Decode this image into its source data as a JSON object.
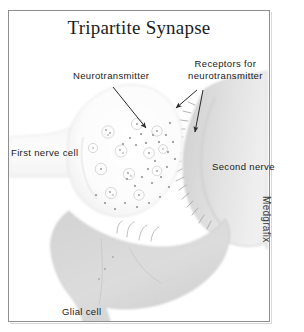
{
  "figure": {
    "title": "Tripartite Synapse",
    "credit": "Medgrafix",
    "frame_color": "#8e8e8e",
    "background_color": "#ffffff"
  },
  "labels": {
    "neurotransmitter": "Neurotransmitter",
    "receptors_line1": "Receptors for",
    "receptors_line2": "neurotransmitter",
    "first_nerve_cell": "First nerve cell",
    "second_nerve": "Second nerve",
    "glial_cell": "Glial cell"
  },
  "diagram": {
    "type": "anatomical-illustration",
    "subject": "tripartite synapse",
    "structures": [
      {
        "name": "presynaptic-terminal",
        "label": "First nerve cell",
        "fill": "#fbfbfb",
        "stroke": "#dcdcdc",
        "position": "left-center",
        "contents": "synaptic vesicles"
      },
      {
        "name": "postsynaptic-cell",
        "label": "Second nerve",
        "fill": "#e4e4e4",
        "stroke": "#cfcfcf",
        "position": "right-center",
        "contents": "receptors for neurotransmitter"
      },
      {
        "name": "glial-cell",
        "label": "Glial cell",
        "fill": "#d9d9d9",
        "stroke": "#c4c4c4",
        "position": "bottom-center"
      },
      {
        "name": "synaptic-cleft",
        "label": "Neurotransmitter",
        "fill": "#ffffff",
        "position": "center",
        "contents": "neurotransmitter molecules"
      }
    ],
    "vesicle_count": 12,
    "neurotransmitter_dot_count": 28,
    "receptor_spine_count": 18,
    "leader_lines": [
      {
        "from": "neurotransmitter-label",
        "to": "synaptic-cleft"
      },
      {
        "from": "receptors-label",
        "to": "postsynaptic-membrane-upper"
      },
      {
        "from": "receptors-label",
        "to": "postsynaptic-membrane-lower"
      }
    ]
  }
}
